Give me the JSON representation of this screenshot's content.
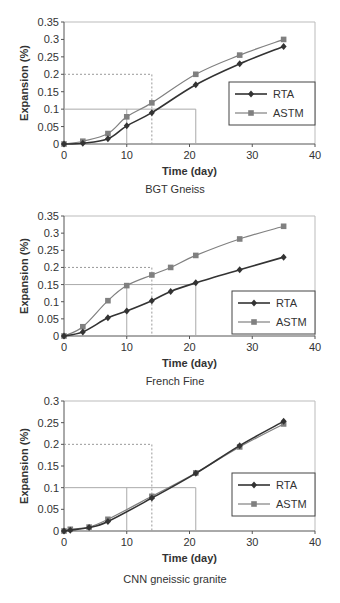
{
  "chart_data": [
    {
      "type": "line",
      "title": "BGT Gneiss",
      "xlabel": "Time (day)",
      "ylabel": "Expansion (%)",
      "xlim": [
        0,
        40
      ],
      "ylim": [
        0,
        0.35
      ],
      "xticks": [
        "0",
        "10",
        "20",
        "30",
        "40"
      ],
      "yticks": [
        "0",
        "0.05",
        "0.1",
        "0.15",
        "0.2",
        "0.25",
        "0.3",
        "0.35"
      ],
      "grid": false,
      "legend_position": "right-middle",
      "series": [
        {
          "name": "RTA",
          "marker": "diamond",
          "color": "#333333",
          "x": [
            0,
            3,
            7,
            10,
            14,
            21,
            28,
            35
          ],
          "values": [
            0,
            0.002,
            0.015,
            0.052,
            0.09,
            0.17,
            0.23,
            0.28
          ]
        },
        {
          "name": "ASTM",
          "marker": "square",
          "color": "#808080",
          "x": [
            0,
            3,
            7,
            10,
            14,
            21,
            28,
            35
          ],
          "values": [
            0,
            0.008,
            0.03,
            0.078,
            0.118,
            0.2,
            0.255,
            0.3
          ]
        }
      ],
      "reference_lines": {
        "dashed": {
          "x": 14,
          "y": 0.2
        },
        "solid": {
          "x1": 10,
          "x2": 21,
          "y": 0.1
        }
      }
    },
    {
      "type": "line",
      "title": "French Fine",
      "xlabel": "Time (day)",
      "ylabel": "Expansion (%)",
      "xlim": [
        0,
        40
      ],
      "ylim": [
        0,
        0.35
      ],
      "xticks": [
        "0",
        "10",
        "20",
        "30",
        "40"
      ],
      "yticks": [
        "0",
        "0.05",
        "0.1",
        "0.15",
        "0.2",
        "0.25",
        "0.3",
        "0.35"
      ],
      "grid": false,
      "legend_position": "right-lower",
      "series": [
        {
          "name": "RTA",
          "marker": "diamond",
          "color": "#333333",
          "x": [
            0,
            3,
            7,
            10,
            14,
            17,
            21,
            28,
            35
          ],
          "values": [
            0,
            0.012,
            0.053,
            0.073,
            0.103,
            0.13,
            0.155,
            0.193,
            0.23
          ]
        },
        {
          "name": "ASTM",
          "marker": "square",
          "color": "#808080",
          "x": [
            0,
            3,
            7,
            10,
            14,
            17,
            21,
            28,
            35
          ],
          "values": [
            0,
            0.027,
            0.103,
            0.147,
            0.178,
            0.2,
            0.235,
            0.283,
            0.32
          ]
        }
      ],
      "reference_lines": {
        "dashed": {
          "x": 14,
          "y": 0.2
        },
        "solid": {
          "x1": 10,
          "x2": 21,
          "y": 0.15
        }
      }
    },
    {
      "type": "line",
      "title": "CNN gneissic granite",
      "xlabel": "Time (day)",
      "ylabel": "Expansion (%)",
      "xlim": [
        0,
        40
      ],
      "ylim": [
        0,
        0.3
      ],
      "xticks": [
        "0",
        "10",
        "20",
        "30",
        "40"
      ],
      "yticks": [
        "0",
        "0.05",
        "0.1",
        "0.15",
        "0.2",
        "0.25",
        "0.3"
      ],
      "grid": false,
      "legend_position": "right-middle",
      "series": [
        {
          "name": "RTA",
          "marker": "diamond",
          "color": "#333333",
          "x": [
            0,
            1,
            4,
            7,
            14,
            21,
            28,
            35
          ],
          "values": [
            0,
            0.002,
            0.008,
            0.022,
            0.076,
            0.133,
            0.197,
            0.253
          ]
        },
        {
          "name": "ASTM",
          "marker": "square",
          "color": "#808080",
          "x": [
            0,
            1,
            4,
            7,
            14,
            21,
            28,
            35
          ],
          "values": [
            0,
            0.004,
            0.009,
            0.027,
            0.08,
            0.134,
            0.194,
            0.247
          ]
        }
      ],
      "reference_lines": {
        "dashed": {
          "x": 14,
          "y": 0.2
        },
        "solid": {
          "x1": 10,
          "x2": 21,
          "y": 0.1
        }
      }
    }
  ],
  "layout": [
    {
      "left": 64,
      "right": 315,
      "top": 22,
      "bottom": 144,
      "legend": {
        "x": 229,
        "y": 82,
        "w": 86,
        "h": 43
      },
      "caption_y": 193
    },
    {
      "left": 64,
      "right": 315,
      "top": 216,
      "bottom": 336,
      "legend": {
        "x": 232,
        "y": 291,
        "w": 83,
        "h": 43
      },
      "caption_y": 385
    },
    {
      "left": 64,
      "right": 315,
      "top": 401,
      "bottom": 531,
      "legend": {
        "x": 232,
        "y": 473,
        "w": 83,
        "h": 43
      },
      "caption_y": 583
    }
  ]
}
